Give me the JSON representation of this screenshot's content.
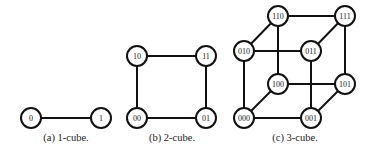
{
  "figure": {
    "subfigures": [
      {
        "id": "a",
        "caption": "(a) 1-cube.",
        "caption_x": 66,
        "nodes": [
          {
            "label": "0",
            "x": 31,
            "y": 118
          },
          {
            "label": "1",
            "x": 101,
            "y": 118
          }
        ],
        "edges": [
          [
            "0",
            "1"
          ]
        ]
      },
      {
        "id": "b",
        "caption": "(b) 2-cube.",
        "caption_x": 172,
        "nodes": [
          {
            "label": "10",
            "x": 137,
            "y": 56
          },
          {
            "label": "11",
            "x": 206,
            "y": 56
          },
          {
            "label": "00",
            "x": 137,
            "y": 118
          },
          {
            "label": "01",
            "x": 206,
            "y": 118
          }
        ],
        "edges": [
          [
            "10",
            "11"
          ],
          [
            "10",
            "00"
          ],
          [
            "11",
            "01"
          ],
          [
            "00",
            "01"
          ]
        ]
      },
      {
        "id": "c",
        "caption": "(c) 3-cube.",
        "caption_x": 295,
        "nodes": [
          {
            "label": "110",
            "x": 278,
            "y": 16
          },
          {
            "label": "111",
            "x": 345,
            "y": 16
          },
          {
            "label": "010",
            "x": 244,
            "y": 51
          },
          {
            "label": "011",
            "x": 311,
            "y": 51
          },
          {
            "label": "100",
            "x": 278,
            "y": 84
          },
          {
            "label": "101",
            "x": 345,
            "y": 84
          },
          {
            "label": "000",
            "x": 244,
            "y": 118
          },
          {
            "label": "001",
            "x": 311,
            "y": 118
          }
        ],
        "edges": [
          [
            "110",
            "111"
          ],
          [
            "110",
            "010"
          ],
          [
            "111",
            "011"
          ],
          [
            "010",
            "011"
          ],
          [
            "110",
            "100"
          ],
          [
            "111",
            "101"
          ],
          [
            "010",
            "000"
          ],
          [
            "011",
            "001"
          ],
          [
            "100",
            "101"
          ],
          [
            "100",
            "000"
          ],
          [
            "101",
            "001"
          ],
          [
            "000",
            "001"
          ]
        ]
      }
    ],
    "node_radius": 10,
    "stroke_color": "#111111",
    "fill_color": "#ffffff"
  }
}
